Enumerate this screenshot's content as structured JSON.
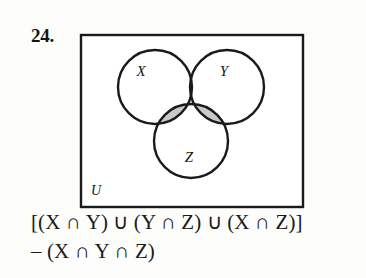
{
  "exercise": {
    "number": "24."
  },
  "diagram": {
    "type": "venn-3-circle",
    "universe_label": "U",
    "circles": [
      {
        "label": "X",
        "cx": 77,
        "cy": 55,
        "r": 37,
        "label_x": 63,
        "label_y": 44
      },
      {
        "label": "Y",
        "cx": 149,
        "cy": 55,
        "r": 37,
        "label_x": 146,
        "label_y": 44
      },
      {
        "label": "Z",
        "cx": 113,
        "cy": 109,
        "r": 37,
        "label_x": 111,
        "label_y": 130
      }
    ],
    "shaded_regions": [
      "X∩Y only",
      "Y∩Z only",
      "X∩Z only"
    ],
    "unshaded_regions": [
      "X∩Y∩Z",
      "X only",
      "Y only",
      "Z only",
      "outside"
    ],
    "shade_color": "#c9c9c9",
    "stroke_color": "#1a1a1a",
    "box_fill": "#ffffff",
    "box": {
      "x": 3,
      "y": 3,
      "width": 222,
      "height": 172
    }
  },
  "formula": {
    "line1": "[(X ∩ Y) ∪ (Y ∩ Z) ∪ (X ∩ Z)]",
    "line2": "– (X ∩ Y ∩ Z)"
  }
}
